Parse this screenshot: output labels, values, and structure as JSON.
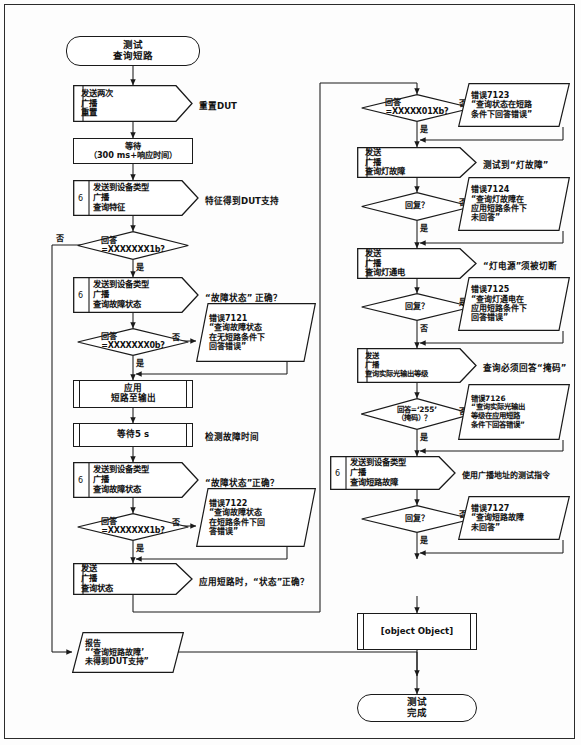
{
  "diagram": {
    "title_start": "测试\n查询短路",
    "title_end": "测试\n完成"
  },
  "left_column": {
    "start": "测试\n查询短路",
    "n1": {
      "text": "发送两次\n广播\n重置",
      "note": "重置DUT"
    },
    "n2": {
      "text": "等待\n（300 ms+响应时间）"
    },
    "n3": {
      "num": "6",
      "text": "发送到设备类型\n广播\n查询特征",
      "note": "特征得到DUT支持"
    },
    "d1": {
      "text": "回答\n=XXXXXXX1b?",
      "yes": "是",
      "no": "否"
    },
    "n4": {
      "num": "6",
      "text": "发送到设备类型\n广播\n查询故障状态",
      "note": "“故障状态” 正确？"
    },
    "d2": {
      "text": "回答\n=XXXXXXX0b?",
      "yes": "是",
      "no": "否"
    },
    "e7121": "错误7121\n“查询故障状态\n在无短路条件下\n回答错误”",
    "n5": {
      "text": "应用\n短路至输出"
    },
    "n6": {
      "text": "等待5 s",
      "note": "检测故障时间"
    },
    "n7": {
      "num": "6",
      "text": "发送到设备类型\n广播\n查询故障状态",
      "note": "“故障状态”正确？"
    },
    "d3": {
      "text": "回答\n=XXXXXXX1b?",
      "yes": "是",
      "no": "否"
    },
    "e7122": "错误7122\n“查询故障状态\n在短路条件下回\n答错误”",
    "n8": {
      "text": "发送\n广播\n查询状态",
      "note": "应用短路时，“状态”正确？"
    },
    "report": "报告\n“‘查询短路故障’\n未得到DUT支持”"
  },
  "right_column": {
    "d4": {
      "text": "回答\n=XXXXX01Xb?",
      "yes": "是",
      "no": "否"
    },
    "e7123": "错误7123\n“查询状态在短路\n条件下回答错误”",
    "n9": {
      "text": "发送\n广播\n查询灯故障",
      "note": "测试到“灯故障”"
    },
    "d5": {
      "text": "回复？",
      "yes": "是",
      "no": "否"
    },
    "e7124": "错误7124\n“查询灯故障在\n应用短路条件下\n未回答”",
    "n10": {
      "text": "发送\n广播\n查询灯通电",
      "note": "“灯电源”须被切断"
    },
    "d6": {
      "text": "回复？",
      "yes": "是",
      "no": "否"
    },
    "e7125": "错误7125\n“查询灯通电在\n应用短路条件下\n回答错误”",
    "n11": {
      "text": "发送\n广播\n查询实际光输出等级",
      "note": "查询必须回答“掩码”"
    },
    "d7": {
      "text": "回答=‘255’\n（掩码）？",
      "yes": "是",
      "no": "否"
    },
    "e7126": "错误7126\n“查询实际光输出\n等级在应用短路\n条件下回答错误”",
    "n12": {
      "num": "6",
      "text": "发送到设备类型\n广播\n查询短路故障",
      "note": "使用广播地址的测试指令"
    },
    "d8": {
      "text": "回复？",
      "yes": "是",
      "no": "否"
    },
    "e7127": "错误7127\n“查询短路故障\n未回答”",
    "n13": {
      "text": "清除\n输出端的短路"
    },
    "end": "测试\n完成"
  },
  "colors": {
    "line": "#1a1a1a",
    "text": "#111111",
    "background": "#ffffff"
  }
}
